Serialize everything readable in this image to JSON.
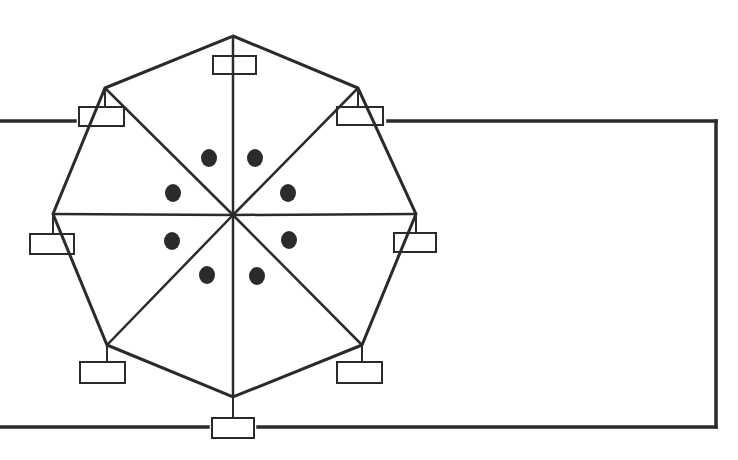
{
  "diagram": {
    "stroke_color": "#2b2b2b",
    "fill_color": "#ffffff",
    "center": {
      "x": 233,
      "y": 215
    },
    "vertices": [
      {
        "id": "top",
        "x": 233,
        "y": 36
      },
      {
        "id": "top-right",
        "x": 358,
        "y": 88
      },
      {
        "id": "right",
        "x": 416,
        "y": 214
      },
      {
        "id": "bottom-right",
        "x": 362,
        "y": 345
      },
      {
        "id": "bottom",
        "x": 233,
        "y": 397
      },
      {
        "id": "bottom-left",
        "x": 107,
        "y": 345
      },
      {
        "id": "left",
        "x": 53,
        "y": 214
      },
      {
        "id": "top-left",
        "x": 105,
        "y": 88
      }
    ],
    "boxes": [
      {
        "id": "box-top",
        "x": 213,
        "y": 56,
        "w": 43,
        "h": 18
      },
      {
        "id": "box-top-right",
        "x": 337,
        "y": 107,
        "w": 46,
        "h": 18
      },
      {
        "id": "box-right",
        "x": 394,
        "y": 233,
        "w": 42,
        "h": 19
      },
      {
        "id": "box-bottom-right",
        "x": 337,
        "y": 362,
        "w": 45,
        "h": 21
      },
      {
        "id": "box-bottom",
        "x": 212,
        "y": 418,
        "w": 42,
        "h": 20
      },
      {
        "id": "box-bottom-left",
        "x": 80,
        "y": 362,
        "w": 45,
        "h": 21
      },
      {
        "id": "box-left",
        "x": 30,
        "y": 234,
        "w": 44,
        "h": 20
      },
      {
        "id": "box-top-left",
        "x": 79,
        "y": 107,
        "w": 45,
        "h": 19
      }
    ],
    "dots": [
      {
        "x": 209,
        "y": 158
      },
      {
        "x": 255,
        "y": 158
      },
      {
        "x": 173,
        "y": 193
      },
      {
        "x": 288,
        "y": 193
      },
      {
        "x": 172,
        "y": 241
      },
      {
        "x": 289,
        "y": 240
      },
      {
        "x": 207,
        "y": 275
      },
      {
        "x": 257,
        "y": 276
      }
    ],
    "outer_loop": {
      "left_segment": {
        "x1": 0,
        "y1": 121,
        "x2": 75,
        "y2": 121
      },
      "top_segment": {
        "x1": 388,
        "y1": 121,
        "x2": 716,
        "y2": 121
      },
      "right_segment": {
        "x1": 716,
        "y1": 121,
        "x2": 716,
        "y2": 427
      },
      "bottom_right_segment": {
        "x1": 258,
        "y1": 427,
        "x2": 716,
        "y2": 427
      },
      "bottom_left_segment": {
        "x1": 0,
        "y1": 427,
        "x2": 208,
        "y2": 427
      }
    }
  }
}
